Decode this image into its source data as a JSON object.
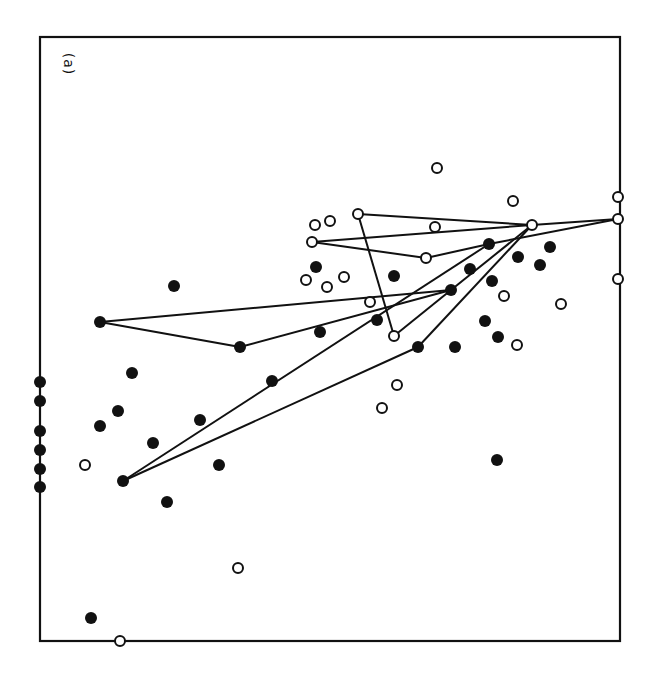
{
  "chart_data": {
    "type": "scatter",
    "title": "",
    "panel_label": "(a)",
    "xlabel": "",
    "ylabel": "",
    "grid": false,
    "legend": null,
    "frame": {
      "left": 40,
      "top": 37,
      "right": 620,
      "bottom": 641
    },
    "colors": {
      "ink": "#111111",
      "background": "#ffffff"
    },
    "series": [
      {
        "name": "filled",
        "marker": "filled-circle",
        "points": [
          [
            40,
            382
          ],
          [
            40,
            401
          ],
          [
            40,
            431
          ],
          [
            40,
            450
          ],
          [
            40,
            469
          ],
          [
            40,
            487
          ],
          [
            91,
            618
          ],
          [
            123,
            481
          ],
          [
            100,
            426
          ],
          [
            118,
            411
          ],
          [
            132,
            373
          ],
          [
            153,
            443
          ],
          [
            167,
            502
          ],
          [
            174,
            286
          ],
          [
            200,
            420
          ],
          [
            219,
            465
          ],
          [
            100,
            322
          ],
          [
            240,
            347
          ],
          [
            272,
            381
          ],
          [
            320,
            332
          ],
          [
            316,
            267
          ],
          [
            394,
            276
          ],
          [
            377,
            320
          ],
          [
            418,
            347
          ],
          [
            455,
            347
          ],
          [
            451,
            290
          ],
          [
            470,
            269
          ],
          [
            489,
            244
          ],
          [
            492,
            281
          ],
          [
            518,
            257
          ],
          [
            540,
            265
          ],
          [
            550,
            247
          ],
          [
            485,
            321
          ],
          [
            498,
            337
          ],
          [
            497,
            460
          ]
        ]
      },
      {
        "name": "open",
        "marker": "open-circle",
        "points": [
          [
            85,
            465
          ],
          [
            120,
            641
          ],
          [
            238,
            568
          ],
          [
            306,
            280
          ],
          [
            315,
            225
          ],
          [
            330,
            221
          ],
          [
            327,
            287
          ],
          [
            344,
            277
          ],
          [
            358,
            214
          ],
          [
            312,
            242
          ],
          [
            370,
            302
          ],
          [
            394,
            336
          ],
          [
            397,
            385
          ],
          [
            382,
            408
          ],
          [
            426,
            258
          ],
          [
            435,
            227
          ],
          [
            437,
            168
          ],
          [
            513,
            201
          ],
          [
            532,
            225
          ],
          [
            504,
            296
          ],
          [
            517,
            345
          ],
          [
            561,
            304
          ],
          [
            618,
            197
          ],
          [
            618,
            219
          ],
          [
            618,
            279
          ]
        ]
      }
    ],
    "segments": [
      [
        [
          100,
          322
        ],
        [
          451,
          290
        ]
      ],
      [
        [
          100,
          322
        ],
        [
          240,
          347
        ]
      ],
      [
        [
          240,
          347
        ],
        [
          451,
          290
        ]
      ],
      [
        [
          123,
          481
        ],
        [
          489,
          244
        ]
      ],
      [
        [
          123,
          481
        ],
        [
          418,
          347
        ]
      ],
      [
        [
          418,
          347
        ],
        [
          532,
          225
        ]
      ],
      [
        [
          394,
          336
        ],
        [
          451,
          290
        ]
      ],
      [
        [
          451,
          290
        ],
        [
          532,
          225
        ]
      ],
      [
        [
          358,
          214
        ],
        [
          394,
          336
        ]
      ],
      [
        [
          358,
          214
        ],
        [
          532,
          225
        ]
      ],
      [
        [
          312,
          242
        ],
        [
          532,
          225
        ]
      ],
      [
        [
          312,
          242
        ],
        [
          426,
          258
        ]
      ],
      [
        [
          426,
          258
        ],
        [
          489,
          244
        ]
      ],
      [
        [
          489,
          244
        ],
        [
          618,
          219
        ]
      ],
      [
        [
          532,
          225
        ],
        [
          618,
          219
        ]
      ]
    ]
  }
}
